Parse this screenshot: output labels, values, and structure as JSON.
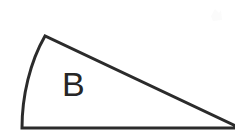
{
  "figure": {
    "background_color": "#ffffff",
    "stroke_color": "#2b2b2b",
    "stroke_width": 3,
    "label_color": "#262626",
    "region_label": "B",
    "label_position": {
      "x": 62,
      "y": 96
    },
    "shape": {
      "name": "curved-wedge",
      "description": "Wedge bounded by a horizontal base, a straight diagonal hypotenuse, and a convex arc on the left",
      "vertices": {
        "apex_top": {
          "x": 45,
          "y": 36
        },
        "base_left": {
          "x": 22,
          "y": 128
        },
        "base_right": {
          "x": 238,
          "y": 128
        }
      },
      "arc": {
        "from": {
          "x": 45,
          "y": 36
        },
        "to": {
          "x": 22,
          "y": 128
        },
        "bulge_direction": "left",
        "leftmost_x": 20
      },
      "edges": [
        {
          "name": "arc-edge-left",
          "type": "arc"
        },
        {
          "name": "base-edge-bottom",
          "type": "line"
        },
        {
          "name": "hypotenuse-edge",
          "type": "line"
        }
      ]
    },
    "artifact": {
      "name": "scan-smudge",
      "x": 210,
      "y": 9,
      "width": 12,
      "height": 12,
      "color": "#fbfbfb"
    }
  }
}
